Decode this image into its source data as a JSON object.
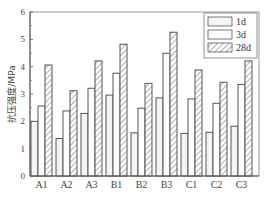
{
  "chart_data": {
    "type": "bar",
    "title": "",
    "xlabel": "",
    "ylabel": "抗压强度/MPa",
    "ylim": [
      0,
      6
    ],
    "yticks": [
      0,
      1,
      2,
      3,
      4,
      5,
      6
    ],
    "grid": false,
    "legend_position": "upper right",
    "categories": [
      "A1",
      "A2",
      "A3",
      "B1",
      "B2",
      "B3",
      "C1",
      "C2",
      "C3"
    ],
    "series": [
      {
        "name": "1d",
        "style": "light-fill",
        "values": [
          2.0,
          1.37,
          2.29,
          2.96,
          1.58,
          2.86,
          1.56,
          1.6,
          1.82
        ]
      },
      {
        "name": "3d",
        "style": "white",
        "values": [
          2.56,
          2.38,
          3.21,
          3.76,
          2.48,
          4.49,
          2.82,
          2.66,
          3.35
        ]
      },
      {
        "name": "28d",
        "style": "hatched",
        "values": [
          4.06,
          3.12,
          4.21,
          4.82,
          3.39,
          5.26,
          3.88,
          3.43,
          4.21
        ]
      }
    ]
  },
  "colors": {
    "axis": "#555555",
    "bar_outline": "#555555",
    "fill_1d": "#f4f4f4",
    "fill_3d": "#ffffff",
    "hatch": "#777777"
  }
}
